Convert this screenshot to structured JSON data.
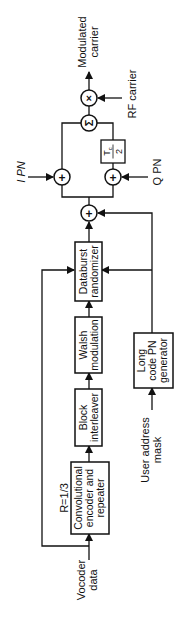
{
  "diagram": {
    "orientation": "rotated-90-ccw",
    "outputs": {
      "modulated_carrier": [
        "Modulated",
        "carrier"
      ]
    },
    "inputs": {
      "rf_carrier": "RF carrier",
      "i_pn": "I PN",
      "q_pn": "Q PN",
      "user_address_mask": [
        "User address",
        "mask"
      ],
      "vocoder_data": [
        "Vocoder",
        "data"
      ]
    },
    "blocks": {
      "databurst_randomizer": [
        "Databurst",
        "randomizer"
      ],
      "walsh_modulation": [
        "Walsh",
        "modulation"
      ],
      "block_interleaver": [
        "Block",
        "interleaver"
      ],
      "conv_encoder": [
        "Convolutional",
        "encoder and",
        "repeater"
      ],
      "conv_rate": "R=1/3",
      "long_code_pn": [
        "Long",
        "code PN",
        "generator"
      ],
      "delay": {
        "numerator": "T",
        "subscript": "c",
        "denominator": "2"
      }
    },
    "operators": {
      "multiplier": "×",
      "summer": "Σ",
      "adder": "+"
    }
  }
}
